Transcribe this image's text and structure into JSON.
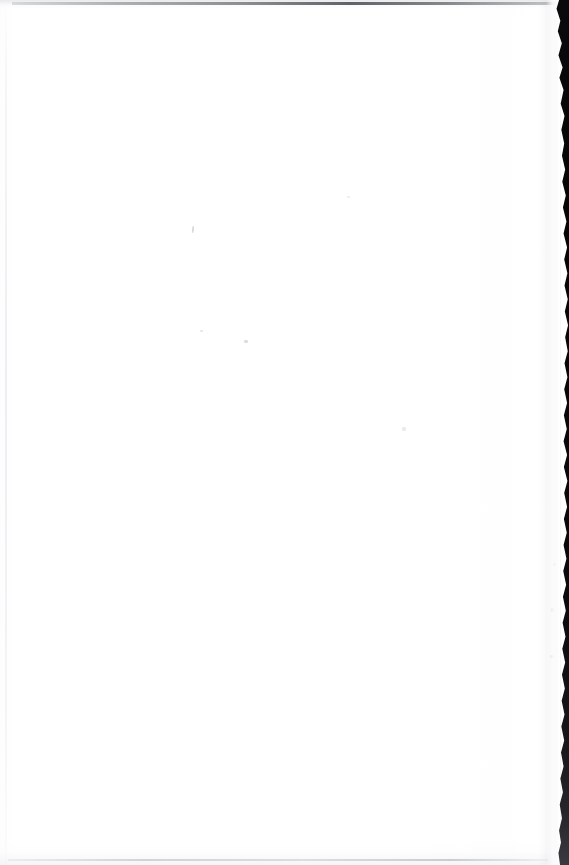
{
  "document": {
    "kind": "scanned-page-image",
    "page_state": "blank",
    "visible_text": "",
    "description": "Blank white scanned page with a dark irregular page-edge band along the right side",
    "width_px": 569,
    "height_px": 865
  },
  "paper": {
    "label": "blank page surface",
    "color": "#ffffff",
    "tint": "#fdfdfe"
  },
  "artifacts": {
    "top_streak": {
      "label": "gray streak along top edge",
      "color": "#46484e"
    },
    "bottom_streak": {
      "label": "faint gray line along bottom edge",
      "color": "#b2b4ba"
    },
    "left_crease": {
      "label": "faint vertical crease near left margin",
      "color": "#dee1e6"
    },
    "right_edge": {
      "label": "dark scanner background beyond torn page edge",
      "color": "#050506"
    },
    "edge_highlight": {
      "label": "bright highlight on curled page edge",
      "color": "#ffffff"
    },
    "specks": {
      "label": "scan dust specks",
      "color": "#bcbec4",
      "count": 8
    }
  }
}
